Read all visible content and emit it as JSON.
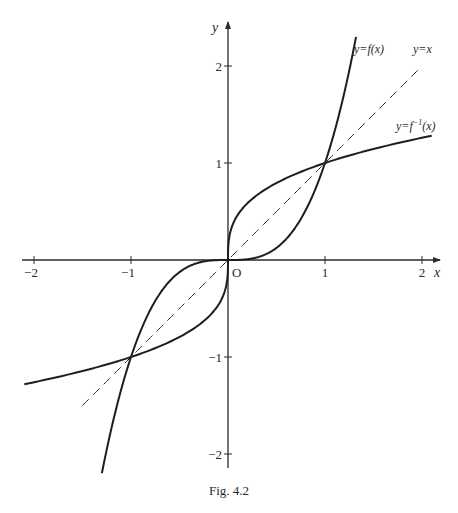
{
  "caption": "Fig. 4.2",
  "chart_data": {
    "type": "line",
    "title": "",
    "xlabel": "x",
    "ylabel": "y",
    "xlim": [
      -2.0,
      2.1
    ],
    "ylim": [
      -2.2,
      2.4
    ],
    "grid": false,
    "origin_label": "O",
    "x_ticks": [
      -2,
      -1,
      1,
      2
    ],
    "x_tick_labels": [
      "−2",
      "−1",
      "1",
      "2"
    ],
    "y_ticks": [
      -2,
      -1,
      1,
      2
    ],
    "y_tick_labels": [
      "−2",
      "−1",
      "1",
      "2"
    ],
    "series": [
      {
        "name": "y=f(x)",
        "style": "solid",
        "function": "x^3",
        "x": [
          -1.3,
          -1.2,
          -1.1,
          -1.0,
          -0.9,
          -0.8,
          -0.6,
          -0.4,
          -0.2,
          0,
          0.2,
          0.4,
          0.6,
          0.8,
          0.9,
          1.0,
          1.1,
          1.2,
          1.32
        ],
        "y": [
          -2.197,
          -1.728,
          -1.331,
          -1.0,
          -0.729,
          -0.512,
          -0.216,
          -0.064,
          -0.008,
          0,
          0.008,
          0.064,
          0.216,
          0.512,
          0.729,
          1.0,
          1.331,
          1.728,
          2.3
        ]
      },
      {
        "name": "y=f⁻¹(x)",
        "style": "solid",
        "function": "cbrt(x)",
        "x": [
          -2.1,
          -1.5,
          -1.0,
          -0.5,
          -0.2,
          -0.05,
          0,
          0.05,
          0.2,
          0.5,
          1.0,
          1.5,
          2.1
        ],
        "y": [
          -1.281,
          -1.145,
          -1.0,
          -0.794,
          -0.585,
          -0.368,
          0,
          0.368,
          0.585,
          0.794,
          1.0,
          1.145,
          1.281
        ]
      },
      {
        "name": "y=x",
        "style": "dashed",
        "function": "x",
        "x": [
          -1.5,
          2.0
        ],
        "y": [
          -1.5,
          2.0
        ]
      }
    ],
    "curve_labels": {
      "f": "y=f(x)",
      "identity": "y=x",
      "inverse_prefix": "y=f",
      "inverse_sup": "−1",
      "inverse_suffix": "(x)"
    },
    "intersections": [
      [
        -1,
        -1
      ],
      [
        0,
        0
      ],
      [
        1,
        1
      ]
    ]
  }
}
